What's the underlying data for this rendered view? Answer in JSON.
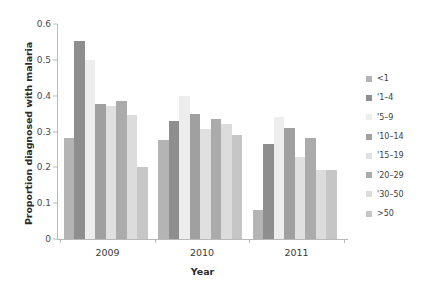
{
  "chart_data": {
    "type": "bar",
    "title": "",
    "xlabel": "Year",
    "ylabel": "Proportion diagnosed with malaria",
    "categories": [
      "2009",
      "2010",
      "2011"
    ],
    "ylim": [
      0,
      0.6
    ],
    "yticks": [
      "0",
      "0.1",
      "0.2",
      "0.3",
      "0.4",
      "0.5",
      "0.6"
    ],
    "ytick_values": [
      0,
      0.1,
      0.2,
      0.3,
      0.4,
      0.5,
      0.6
    ],
    "grid": false,
    "legend_position": "right",
    "series": [
      {
        "name": "<1",
        "color": "#b4b4b4",
        "values": [
          0.281,
          0.275,
          0.082
        ]
      },
      {
        "name": "'1–4",
        "color": "#8e8e8e",
        "values": [
          0.553,
          0.33,
          0.265
        ]
      },
      {
        "name": "'5–9",
        "color": "#ededed",
        "values": [
          0.5,
          0.398,
          0.34
        ]
      },
      {
        "name": "'10–14",
        "color": "#a0a0a0",
        "values": [
          0.378,
          0.348,
          0.31
        ]
      },
      {
        "name": "'15–19",
        "color": "#e0e0e0",
        "values": [
          0.37,
          0.308,
          0.23
        ]
      },
      {
        "name": "'20–29",
        "color": "#ababab",
        "values": [
          0.385,
          0.335,
          0.282
        ]
      },
      {
        "name": "'30–50",
        "color": "#dcdcdc",
        "values": [
          0.345,
          0.32,
          0.192
        ]
      },
      {
        "name": ">50",
        "color": "#c6c6c6",
        "values": [
          0.2,
          0.29,
          0.193
        ]
      }
    ]
  }
}
